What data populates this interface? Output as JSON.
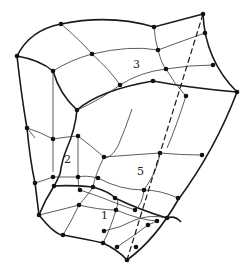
{
  "diagram": {
    "type": "mesh-surface",
    "patch_labels": [
      {
        "id": "label-1",
        "text": "1",
        "x": 101,
        "y": 219
      },
      {
        "id": "label-2",
        "text": "2",
        "x": 64,
        "y": 163
      },
      {
        "id": "label-3",
        "text": "3",
        "x": 133,
        "y": 68
      },
      {
        "id": "label-5",
        "text": "5",
        "x": 137,
        "y": 175
      }
    ],
    "colors": {
      "line": "#1a1a1a",
      "node": "#111111",
      "background": "#ffffff"
    }
  }
}
